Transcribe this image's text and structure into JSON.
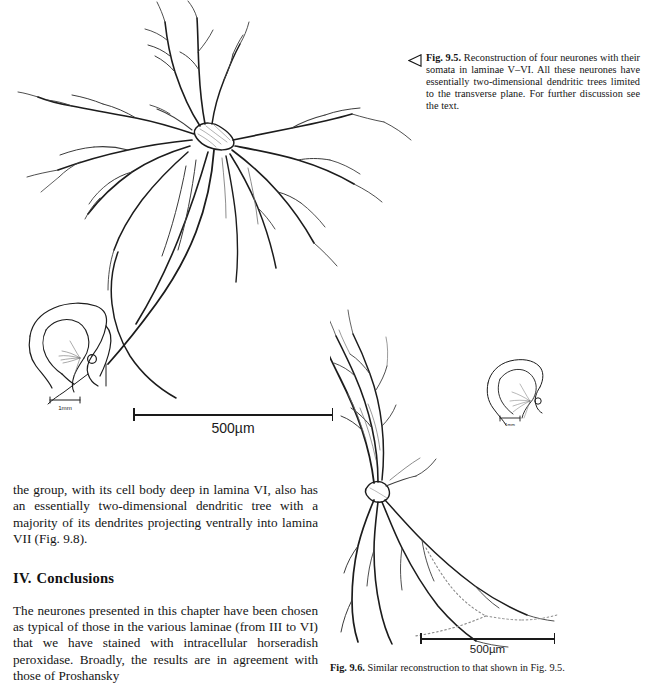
{
  "page": {
    "background_color": "#ffffff",
    "ink_color": "#1c1c1c",
    "width": 645,
    "height": 681
  },
  "figures": {
    "fig95": {
      "id": "fig-9-5",
      "caption_arrow_icon": "left-triangle-outline-icon",
      "label": "Fig. 9.5.",
      "caption_text": "Reconstruction of four neurones with their somata in laminae V–VI. All these neurones have essentially two-dimensional dendritic trees limited to the transverse plane. For further discussion see the text.",
      "scalebar": {
        "label": "500µm",
        "length_px": 200
      },
      "inset": {
        "name": "spinal-cord-transverse-section",
        "scalebar_label": "1mm"
      }
    },
    "fig96": {
      "id": "fig-9-6",
      "label": "Fig. 9.6.",
      "caption_text": "Similar reconstruction to that shown in Fig. 9.5.",
      "scalebar": {
        "label": "500µm",
        "length_px": 135
      },
      "inset": {
        "name": "spinal-cord-transverse-section",
        "scalebar_label": "1mm"
      }
    }
  },
  "body": {
    "paragraph_continued": "the group, with its cell body deep in lamina VI, also has an essentially two-dimensional dendritic tree with a majority of its dendrites projecting ventrally into lamina VII (Fig. 9.8).",
    "heading": {
      "numeral": "IV.",
      "title": "Conclusions"
    },
    "paragraph_conclusions": "The neurones presented in this chapter have been chosen as typical of those in the various laminae (from III to VI) that we have stained with intracellular horseradish peroxidase. Broadly, the results are in agreement with those of Proshansky"
  }
}
